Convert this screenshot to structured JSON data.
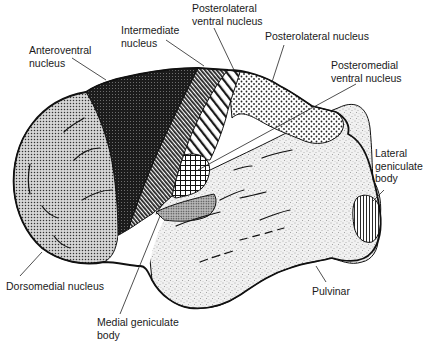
{
  "diagram": {
    "labels": [
      {
        "id": "anteroventral",
        "text": "Anteroventral\nnucleus",
        "x": 29,
        "y": 44
      },
      {
        "id": "intermediate",
        "text": "Intermediate\nnucleus",
        "x": 121,
        "y": 24
      },
      {
        "id": "posterolateral-ventral",
        "text": "Posterolateral\nventral nucleus",
        "x": 192,
        "y": 2
      },
      {
        "id": "posterolateral",
        "text": "Posterolateral nucleus",
        "x": 265,
        "y": 30
      },
      {
        "id": "posteromedial-ventral",
        "text": "Posteromedial\nventral nucleus",
        "x": 331,
        "y": 59
      },
      {
        "id": "lateral-geniculate",
        "text": "Lateral\ngeniculate\nbody",
        "x": 375,
        "y": 147
      },
      {
        "id": "dorsomedial",
        "text": "Dorsomedial nucleus",
        "x": 6,
        "y": 280
      },
      {
        "id": "pulvinar",
        "text": "Pulvinar",
        "x": 312,
        "y": 285
      },
      {
        "id": "medial-geniculate",
        "text": "Medial geniculate\nbody",
        "x": 97,
        "y": 316
      }
    ],
    "regions": [
      {
        "id": "dorsomedial",
        "pattern": "fine-dots",
        "color": "#9a9a9a"
      },
      {
        "id": "anteroventral",
        "pattern": "dense-dark",
        "color": "#2a2a2a"
      },
      {
        "id": "intermediate",
        "pattern": "diagonal-dense",
        "color": "#555555"
      },
      {
        "id": "posterolateral-ventral",
        "pattern": "diagonal-wide",
        "color": "#ffffff"
      },
      {
        "id": "posterolateral",
        "pattern": "coarse-dots",
        "color": "#dcdcdc"
      },
      {
        "id": "posteromedial-ventral",
        "pattern": "crosshatch",
        "color": "#ffffff"
      },
      {
        "id": "medial-geniculate",
        "pattern": "medium-dots",
        "color": "#8a8a8a"
      },
      {
        "id": "pulvinar",
        "pattern": "stipple",
        "color": "#ededed"
      },
      {
        "id": "lateral-geniculate",
        "pattern": "vertical-lines",
        "color": "#ffffff"
      }
    ]
  }
}
